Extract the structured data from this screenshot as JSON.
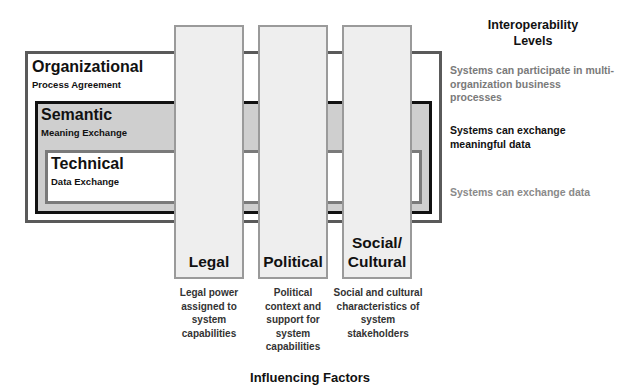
{
  "levels_header": "Interoperability Levels",
  "levels": [
    {
      "key": "organizational",
      "title": "Organizational",
      "subtitle": "Process Agreement",
      "description": "Systems can participate in multi-organization business processes",
      "description_color": "#7a7a7a",
      "border_color": "#5a5a5a",
      "fill": "#ffffff"
    },
    {
      "key": "semantic",
      "title": "Semantic",
      "subtitle": "Meaning Exchange",
      "description": "Systems can exchange meaningful data",
      "description_color": "#111111",
      "border_color": "#111111",
      "fill": "#cfcfcf"
    },
    {
      "key": "technical",
      "title": "Technical",
      "subtitle": "Data Exchange",
      "description": "Systems can exchange data",
      "description_color": "#8a8a8a",
      "border_color": "#7a7a7a",
      "fill": "#ffffff"
    }
  ],
  "factors_header": "Influencing Factors",
  "factors": [
    {
      "key": "legal",
      "label": "Legal",
      "description": "Legal power assigned to system capabilities"
    },
    {
      "key": "political",
      "label": "Political",
      "description": "Political context and support for system capabilities"
    },
    {
      "key": "social",
      "label": "Social/ Cultural",
      "description": "Social and cultural characteristics of system stakeholders"
    }
  ]
}
